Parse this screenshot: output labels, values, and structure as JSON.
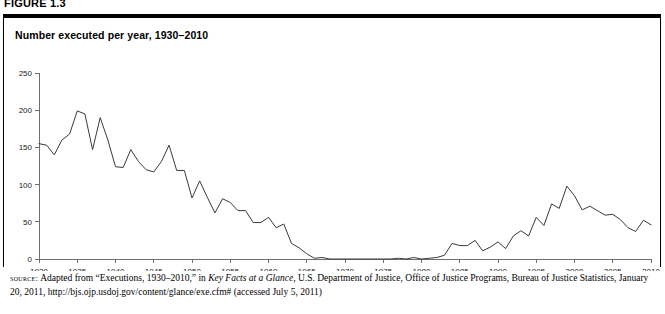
{
  "figure": {
    "label": "FIGURE 1.3",
    "title": "Number executed per year, 1930–2010"
  },
  "source_note": {
    "kicker": "source:",
    "part1": " Adapted from “Executions, 1930–2010,” in ",
    "italic1": "Key Facts at a Glance",
    "part2": ", U.S. Department of Justice, Office of Justice Programs, Bureau of Justice Statistics, January 20, 2011, http://bjs.ojp.usdoj.gov/content/glance/exe.cfm# (accessed July 5, 2011)"
  },
  "chart_data": {
    "type": "line",
    "title": "Number executed per year, 1930–2010",
    "xlabel": "",
    "ylabel": "",
    "xlim": [
      1930,
      2010
    ],
    "ylim": [
      0,
      250
    ],
    "ytick_values": [
      0,
      50,
      100,
      150,
      200,
      250
    ],
    "ytick_labels": [
      "0",
      "50",
      "100",
      "150",
      "200",
      "250"
    ],
    "xtick_values": [
      1930,
      1935,
      1940,
      1945,
      1950,
      1955,
      1960,
      1965,
      1970,
      1975,
      1980,
      1985,
      1990,
      1995,
      2000,
      2005,
      2010
    ],
    "xtick_labels": [
      "1930",
      "1935",
      "1940",
      "1945",
      "1950",
      "1955",
      "1960",
      "1965",
      "1970",
      "1975",
      "1980",
      "1985",
      "1990",
      "1995",
      "2000",
      "2005",
      "2010"
    ],
    "grid": false,
    "legend": null,
    "line_color": "#3a3a3a",
    "series": [
      {
        "name": "Number executed per year",
        "x": [
          1930,
          1931,
          1932,
          1933,
          1934,
          1935,
          1936,
          1937,
          1938,
          1939,
          1940,
          1941,
          1942,
          1943,
          1944,
          1945,
          1946,
          1947,
          1948,
          1949,
          1950,
          1951,
          1952,
          1953,
          1954,
          1955,
          1956,
          1957,
          1958,
          1959,
          1960,
          1961,
          1962,
          1963,
          1964,
          1965,
          1966,
          1967,
          1968,
          1969,
          1970,
          1971,
          1972,
          1973,
          1974,
          1975,
          1976,
          1977,
          1978,
          1979,
          1980,
          1981,
          1982,
          1983,
          1984,
          1985,
          1986,
          1987,
          1988,
          1989,
          1990,
          1991,
          1992,
          1993,
          1994,
          1995,
          1996,
          1997,
          1998,
          1999,
          2000,
          2001,
          2002,
          2003,
          2004,
          2005,
          2006,
          2007,
          2008,
          2009,
          2010
        ],
        "values": [
          155,
          153,
          140,
          160,
          168,
          199,
          195,
          147,
          190,
          160,
          124,
          123,
          147,
          131,
          120,
          117,
          131,
          153,
          119,
          119,
          82,
          105,
          83,
          62,
          81,
          76,
          65,
          65,
          49,
          49,
          56,
          42,
          47,
          21,
          15,
          7,
          1,
          2,
          0,
          0,
          0,
          0,
          0,
          0,
          0,
          0,
          0,
          1,
          0,
          2,
          0,
          1,
          2,
          5,
          21,
          18,
          18,
          25,
          11,
          16,
          23,
          14,
          31,
          38,
          31,
          56,
          45,
          74,
          68,
          98,
          85,
          66,
          71,
          65,
          59,
          60,
          53,
          42,
          37,
          52,
          46
        ]
      }
    ]
  }
}
